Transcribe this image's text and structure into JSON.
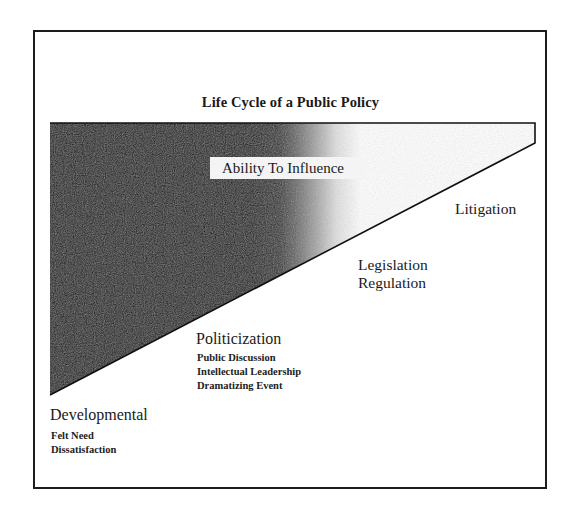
{
  "diagram": {
    "title": "Life Cycle of a Public Policy",
    "wedge_label": "Ability To Influence",
    "colors": {
      "wedge_dark": "#000000",
      "wedge_light": "#ffffff",
      "frame": "#1c1c1c",
      "label_bg": "#f4f4f4"
    },
    "stages": [
      {
        "name": "Developmental",
        "items": [
          "Felt Need",
          "Dissatisfaction"
        ]
      },
      {
        "name": "Politicization",
        "items": [
          "Public Discussion",
          "Intellectual Leadership",
          "Dramatizing Event"
        ]
      },
      {
        "name": "Legislation",
        "name_line2": "Regulation",
        "items": []
      },
      {
        "name": "Litigation",
        "items": []
      }
    ]
  }
}
